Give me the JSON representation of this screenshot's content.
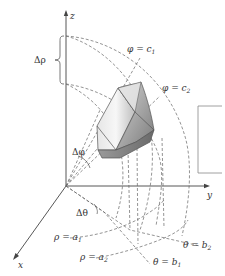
{
  "figure": {
    "axes": {
      "z_label": "z",
      "y_label": "y",
      "x_label": "x"
    },
    "labels": {
      "delta_rho": "Δρ",
      "delta_phi": "Δφ",
      "delta_theta": "Δθ",
      "phi_c1": {
        "lhs": "φ = c",
        "sub": "1"
      },
      "phi_c2": {
        "lhs": "φ = c",
        "sub": "2"
      },
      "rho_a1": {
        "lhs": "ρ = a",
        "sub": "1"
      },
      "rho_a2": {
        "lhs": "ρ = a",
        "sub": "2"
      },
      "theta_b1": {
        "lhs": "θ = b",
        "sub": "1"
      },
      "theta_b2": {
        "lhs": "θ = b",
        "sub": "2"
      }
    },
    "colors": {
      "axis": "#444444",
      "dashed": "#666666",
      "solid_light": "#f2f2f2",
      "solid_mid": "#c8c8c8",
      "solid_dark": "#8a8a8a"
    }
  }
}
